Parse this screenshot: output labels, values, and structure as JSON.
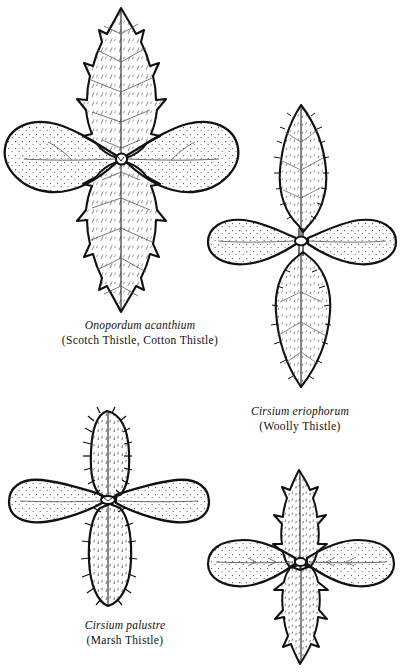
{
  "plate": {
    "background_color": "#ffffff",
    "ink_color": "#111111",
    "figure_count": 4
  },
  "figures": [
    {
      "id": "onopordum-acanthium",
      "sci_name": "Onopordum acanthium",
      "common_name": "(Scotch Thistle, Cotton Thistle)",
      "position": "top-left",
      "leaf_margin": "spiny-toothed",
      "cotyledon_shape": "spatulate"
    },
    {
      "id": "cirsium-eriophorum",
      "sci_name": "Cirsium eriophorum",
      "common_name": "(Woolly Thistle)",
      "position": "top-right",
      "leaf_margin": "bristly-entire",
      "cotyledon_shape": "spatulate"
    },
    {
      "id": "cirsium-palustre",
      "sci_name": "Cirsium palustre",
      "common_name": "(Marsh Thistle)",
      "position": "bottom-left",
      "leaf_margin": "bristly-oblong",
      "cotyledon_shape": "oblong"
    },
    {
      "id": "unlabelled-thistle",
      "sci_name": "",
      "common_name": "",
      "position": "bottom-right",
      "leaf_margin": "deeply-spiny-lobed",
      "cotyledon_shape": "spatulate"
    }
  ]
}
